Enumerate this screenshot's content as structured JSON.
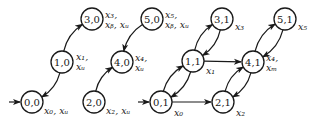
{
  "diagram": {
    "colors": {
      "stroke": "#1a1a1a",
      "fill": "#ffffff"
    },
    "nodes": [
      {
        "id": "0,0",
        "label": "0,0",
        "x": 32,
        "y": 102,
        "initial": true,
        "out_lines": [
          "x₀, xᵤ"
        ],
        "ox": 44,
        "oy": 114
      },
      {
        "id": "1,0",
        "label": "1,0",
        "x": 62,
        "y": 62,
        "out_lines": [
          "x₁,",
          "xᵤ"
        ],
        "ox": 76,
        "oy": 62
      },
      {
        "id": "3,0",
        "label": "3,0",
        "x": 92,
        "y": 19,
        "out_lines": [
          "x₃,",
          "xᵦ, xᵤ"
        ],
        "ox": 105,
        "oy": 20
      },
      {
        "id": "2,0",
        "label": "2,0",
        "x": 94,
        "y": 102,
        "out_lines": [
          "x₂, xᵤ"
        ],
        "ox": 106,
        "oy": 114
      },
      {
        "id": "4,0",
        "label": "4,0",
        "x": 122,
        "y": 62,
        "out_lines": [
          "x₄,",
          "xᵤ"
        ],
        "ox": 135,
        "oy": 63
      },
      {
        "id": "5,0",
        "label": "5,0",
        "x": 152,
        "y": 19,
        "out_lines": [
          "x₅,",
          "xᵦ, xᵤ"
        ],
        "ox": 165,
        "oy": 20
      },
      {
        "id": "0,1",
        "label": "0,1",
        "x": 161,
        "y": 102,
        "initial": true,
        "out_lines": [
          "x₀"
        ],
        "ox": 174,
        "oy": 116
      },
      {
        "id": "1,1",
        "label": "1,1",
        "x": 193,
        "y": 61,
        "out_lines": [
          "x₁"
        ],
        "ox": 206,
        "oy": 74
      },
      {
        "id": "3,1",
        "label": "3,1",
        "x": 222,
        "y": 19,
        "out_lines": [
          "x₃"
        ],
        "ox": 235,
        "oy": 30
      },
      {
        "id": "2,1",
        "label": "2,1",
        "x": 223,
        "y": 102,
        "out_lines": [
          "x₂"
        ],
        "ox": 236,
        "oy": 116
      },
      {
        "id": "4,1",
        "label": "4,1",
        "x": 253,
        "y": 62,
        "out_lines": [
          "x₄,",
          "xₘ"
        ],
        "ox": 266,
        "oy": 63
      },
      {
        "id": "5,1",
        "label": "5,1",
        "x": 285,
        "y": 19,
        "out_lines": [
          "x₅"
        ],
        "ox": 298,
        "oy": 30
      }
    ],
    "edges": [
      {
        "from": "1,0",
        "to": "3,0",
        "curve": "left"
      },
      {
        "from": "1,0",
        "to": "0,0",
        "curve": "left"
      },
      {
        "from": "2,0",
        "to": "4,0",
        "curve": "left"
      },
      {
        "from": "5,0",
        "to": "4,0",
        "curve": "right"
      },
      {
        "from": "0,1",
        "to": "1,1",
        "curve": "left"
      },
      {
        "from": "1,1",
        "to": "0,1",
        "curve": "left"
      },
      {
        "from": "1,1",
        "to": "3,1",
        "curve": "left"
      },
      {
        "from": "3,1",
        "to": "1,1",
        "curve": "left"
      },
      {
        "from": "1,1",
        "to": "4,1",
        "curve": "straight"
      },
      {
        "from": "0,1",
        "to": "2,1",
        "curve": "straight"
      },
      {
        "from": "2,1",
        "to": "4,1",
        "curve": "left"
      },
      {
        "from": "4,1",
        "to": "2,1",
        "curve": "left"
      },
      {
        "from": "4,1",
        "to": "5,1",
        "curve": "left"
      },
      {
        "from": "5,1",
        "to": "4,1",
        "curve": "left"
      }
    ]
  }
}
